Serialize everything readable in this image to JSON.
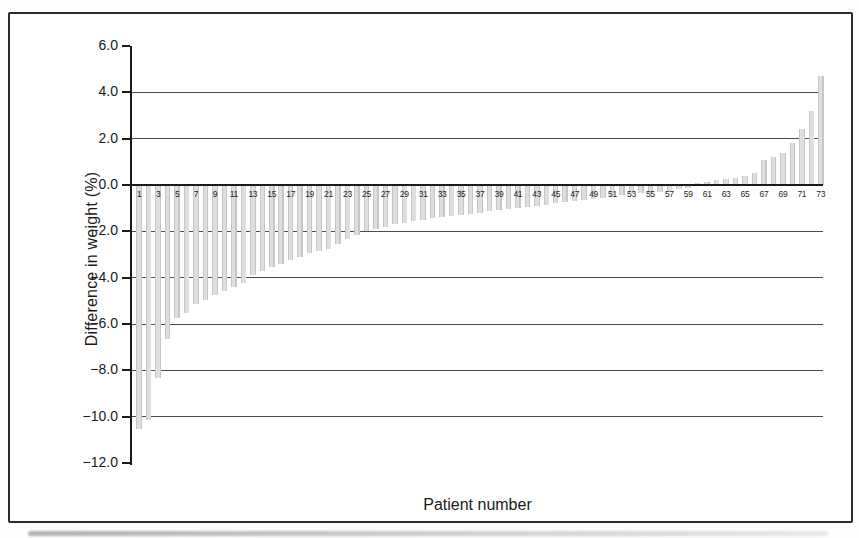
{
  "figure": {
    "background_color": "#ffffff",
    "frame_border_color": "#2b2b2b"
  },
  "chart_data": {
    "type": "bar",
    "title": "",
    "xlabel": "Patient number",
    "ylabel": "Difference in weight (%)",
    "x": [
      1,
      2,
      3,
      4,
      5,
      6,
      7,
      8,
      9,
      10,
      11,
      12,
      13,
      14,
      15,
      16,
      17,
      18,
      19,
      20,
      21,
      22,
      23,
      24,
      25,
      26,
      27,
      28,
      29,
      30,
      31,
      32,
      33,
      34,
      35,
      36,
      37,
      38,
      39,
      40,
      41,
      42,
      43,
      44,
      45,
      46,
      47,
      48,
      49,
      50,
      51,
      52,
      53,
      54,
      55,
      56,
      57,
      58,
      59,
      60,
      61,
      62,
      63,
      64,
      65,
      66,
      67,
      68,
      69,
      70,
      71,
      72,
      73
    ],
    "values": [
      -10.5,
      -10.1,
      -8.3,
      -6.6,
      -5.7,
      -5.5,
      -5.1,
      -4.9,
      -4.7,
      -4.55,
      -4.35,
      -4.2,
      -3.85,
      -3.65,
      -3.5,
      -3.35,
      -3.2,
      -3.05,
      -2.9,
      -2.8,
      -2.7,
      -2.5,
      -2.3,
      -2.1,
      -1.95,
      -1.85,
      -1.75,
      -1.65,
      -1.6,
      -1.5,
      -1.45,
      -1.4,
      -1.35,
      -1.3,
      -1.25,
      -1.2,
      -1.15,
      -1.1,
      -1.05,
      -1.0,
      -0.95,
      -0.9,
      -0.85,
      -0.8,
      -0.75,
      -0.7,
      -0.65,
      -0.6,
      -0.55,
      -0.5,
      -0.45,
      -0.4,
      -0.35,
      -0.3,
      -0.3,
      -0.25,
      -0.2,
      -0.15,
      -0.1,
      0.1,
      0.15,
      0.2,
      0.25,
      0.3,
      0.4,
      0.5,
      1.1,
      1.2,
      1.4,
      1.8,
      2.4,
      3.2,
      4.7
    ],
    "ylim": [
      -12.0,
      6.0
    ],
    "yticks": [
      6,
      4,
      2,
      0,
      -2,
      -4,
      -6,
      -8,
      -10,
      -12
    ],
    "ytick_labels": [
      "6.0",
      "4.0",
      "2.0",
      "0.0",
      "−2.0",
      "−4.0",
      "−6.0",
      "−8.0",
      "−10.0",
      "−12.0"
    ],
    "gridline_values": [
      4,
      2,
      -2,
      -4,
      -6,
      -8,
      -10
    ],
    "xtick_labels": [
      "1",
      "3",
      "5",
      "7",
      "9",
      "11",
      "13",
      "15",
      "17",
      "19",
      "21",
      "23",
      "25",
      "27",
      "29",
      "31",
      "33",
      "35",
      "37",
      "39",
      "41",
      "43",
      "45",
      "47",
      "49",
      "51",
      "53",
      "55",
      "57",
      "59",
      "61",
      "63",
      "65",
      "67",
      "69",
      "71",
      "73"
    ],
    "grid": true,
    "legend": "none",
    "bar_color": "#dedede",
    "bar_edge_color": "#c6c6c6",
    "gridline_color": "#4d4d4d",
    "axis_color": "#1b1b1b",
    "text_color": "#1a1a1a"
  }
}
